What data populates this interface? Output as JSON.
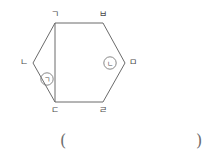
{
  "figure": {
    "type": "hexagon-with-diagonal",
    "stroke_color": "#6b6b6b",
    "label_color": "#4a4a4a",
    "vertices": [
      {
        "name": "top-left",
        "label": "ㄱ",
        "x": 55,
        "y": 23
      },
      {
        "name": "top-right",
        "label": "ㅂ",
        "x": 103,
        "y": 23
      },
      {
        "name": "right",
        "label": "ㅁ",
        "x": 125,
        "y": 63
      },
      {
        "name": "bottom-right",
        "label": "ㄹ",
        "x": 103,
        "y": 102
      },
      {
        "name": "bottom-left",
        "label": "ㄷ",
        "x": 55,
        "y": 102
      },
      {
        "name": "left",
        "label": "ㄴ",
        "x": 33,
        "y": 63
      }
    ],
    "diagonal": {
      "from": "ㄱ",
      "to": "ㄷ"
    },
    "angle_markers": [
      {
        "name": "angle-marker-1",
        "label": "ㄱ",
        "circled": "㈠",
        "at_vertex": "ㄷ",
        "x": 47,
        "y": 79
      },
      {
        "name": "angle-marker-2",
        "label": "ㄴ",
        "circled": "㈡",
        "at_vertex": "ㅁ",
        "x": 110,
        "y": 63
      }
    ]
  },
  "answer": {
    "open_paren": "(",
    "close_paren": ")"
  }
}
